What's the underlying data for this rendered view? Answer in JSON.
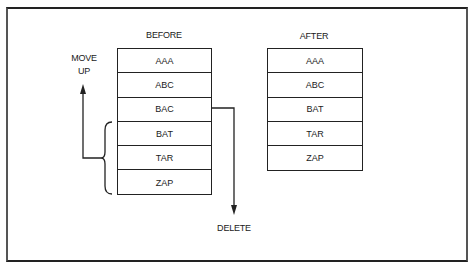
{
  "diagram": {
    "before": {
      "title": "BEFORE",
      "rows": [
        "AAA",
        "ABC",
        "BAC",
        "BAT",
        "TAR",
        "ZAP"
      ]
    },
    "after": {
      "title": "AFTER",
      "rows": [
        "AAA",
        "ABC",
        "BAT",
        "TAR",
        "ZAP"
      ]
    },
    "annotations": {
      "move_up_line1": "MOVE",
      "move_up_line2": "UP",
      "delete": "DELETE"
    },
    "colors": {
      "stroke": "#222222",
      "background": "#ffffff"
    }
  }
}
